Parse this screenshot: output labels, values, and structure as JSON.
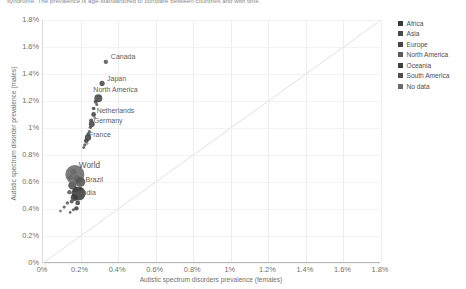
{
  "subtitle": "syndrome. The prevalence is age-standardized to compare between countries and with time.",
  "axes": {
    "x_title": "Autistic spectrum disorders prevalence (females)",
    "y_title": "Autistic spectrum disorder prevalence (males)",
    "x_ticks": [
      "0%",
      "0.2%",
      "0.4%",
      "0.6%",
      "0.8%",
      "1%",
      "1.2%",
      "1.4%",
      "1.6%",
      "1.8%"
    ],
    "y_ticks": [
      "0%",
      "0.2%",
      "0.4%",
      "0.6%",
      "0.8%",
      "1%",
      "1.2%",
      "1.4%",
      "1.6%",
      "1.8%"
    ]
  },
  "legend": {
    "items": [
      {
        "label": "Africa",
        "color": "#3a3a3a"
      },
      {
        "label": "Asia",
        "color": "#4a4a4a"
      },
      {
        "label": "Europe",
        "color": "#454545"
      },
      {
        "label": "North America",
        "color": "#5a5a5a"
      },
      {
        "label": "Oceania",
        "color": "#3f3f3f"
      },
      {
        "label": "South America",
        "color": "#4e4e4e"
      },
      {
        "label": "No data",
        "color": "#6a6a6a"
      }
    ]
  },
  "chart_data": {
    "type": "scatter",
    "title": "",
    "subtitle": "syndrome. The prevalence is age-standardized to compare between countries and with time.",
    "xlabel": "Autistic spectrum disorders prevalence (females)",
    "ylabel": "Autistic spectrum disorder prevalence (males)",
    "xlim": [
      0,
      1.8
    ],
    "ylim": [
      0,
      1.8
    ],
    "xunit": "%",
    "yunit": "%",
    "grid": true,
    "legend_position": "right",
    "reference_line": {
      "type": "y=x",
      "color": "#e2e2e2"
    },
    "labeled_points": [
      {
        "name": "Canada",
        "x": 0.34,
        "y": 1.49,
        "r": 2.2,
        "color": "#555555"
      },
      {
        "name": "Japan",
        "x": 0.32,
        "y": 1.33,
        "r": 2.6,
        "color": "#4c4c4c"
      },
      {
        "name": "North America",
        "x": 0.3,
        "y": 1.22,
        "r": 4.0,
        "color": "#4a4a4a"
      },
      {
        "name": "Netherlands",
        "x": 0.275,
        "y": 1.1,
        "r": 2.4,
        "color": "#444444"
      },
      {
        "name": "Germany",
        "x": 0.265,
        "y": 1.03,
        "r": 3.0,
        "color": "#474747"
      },
      {
        "name": "France",
        "x": 0.245,
        "y": 0.93,
        "r": 3.2,
        "color": "#434343"
      },
      {
        "name": "World",
        "x": 0.175,
        "y": 0.655,
        "r": 9.5,
        "color": "#6a6a6a"
      },
      {
        "name": "Brazil",
        "x": 0.205,
        "y": 0.6,
        "r": 4.8,
        "color": "#555555"
      },
      {
        "name": "India",
        "x": 0.195,
        "y": 0.515,
        "r": 7.0,
        "color": "#3c3c3c"
      }
    ],
    "other_points": [
      {
        "x": 0.305,
        "y": 1.235,
        "r": 1.4,
        "color": "#8f8f8f"
      },
      {
        "x": 0.286,
        "y": 1.195,
        "r": 2.0,
        "color": "#4f4f4f"
      },
      {
        "x": 0.292,
        "y": 1.175,
        "r": 1.5,
        "color": "#595959"
      },
      {
        "x": 0.275,
        "y": 1.145,
        "r": 1.8,
        "color": "#464646"
      },
      {
        "x": 0.281,
        "y": 1.075,
        "r": 1.4,
        "color": "#8a8a8a"
      },
      {
        "x": 0.262,
        "y": 1.055,
        "r": 2.1,
        "color": "#4b4b4b"
      },
      {
        "x": 0.258,
        "y": 1.005,
        "r": 1.7,
        "color": "#525252"
      },
      {
        "x": 0.252,
        "y": 0.975,
        "r": 1.5,
        "color": "#585858"
      },
      {
        "x": 0.246,
        "y": 0.955,
        "r": 1.8,
        "color": "#4a4a4a"
      },
      {
        "x": 0.236,
        "y": 0.905,
        "r": 2.4,
        "color": "#414141"
      },
      {
        "x": 0.228,
        "y": 0.875,
        "r": 1.6,
        "color": "#505050"
      },
      {
        "x": 0.241,
        "y": 0.885,
        "r": 1.2,
        "color": "#8d8d8d"
      },
      {
        "x": 0.222,
        "y": 0.855,
        "r": 1.4,
        "color": "#4d4d4d"
      },
      {
        "x": 0.168,
        "y": 0.675,
        "r": 3.0,
        "color": "#666666"
      },
      {
        "x": 0.152,
        "y": 0.635,
        "r": 2.6,
        "color": "#5e5e5e"
      },
      {
        "x": 0.186,
        "y": 0.625,
        "r": 3.4,
        "color": "#555555"
      },
      {
        "x": 0.162,
        "y": 0.575,
        "r": 4.2,
        "color": "#4f4f4f"
      },
      {
        "x": 0.178,
        "y": 0.545,
        "r": 2.8,
        "color": "#606060"
      },
      {
        "x": 0.146,
        "y": 0.525,
        "r": 2.2,
        "color": "#5a5a5a"
      },
      {
        "x": 0.205,
        "y": 0.545,
        "r": 2.0,
        "color": "#484848"
      },
      {
        "x": 0.172,
        "y": 0.485,
        "r": 3.6,
        "color": "#3f3f3f"
      },
      {
        "x": 0.158,
        "y": 0.455,
        "r": 2.0,
        "color": "#545454"
      },
      {
        "x": 0.19,
        "y": 0.445,
        "r": 2.4,
        "color": "#464646"
      },
      {
        "x": 0.135,
        "y": 0.445,
        "r": 1.8,
        "color": "#626262"
      },
      {
        "x": 0.118,
        "y": 0.415,
        "r": 1.6,
        "color": "#575757"
      },
      {
        "x": 0.183,
        "y": 0.405,
        "r": 2.2,
        "color": "#3d3d3d"
      },
      {
        "x": 0.167,
        "y": 0.395,
        "r": 1.5,
        "color": "#5b5b5b"
      },
      {
        "x": 0.098,
        "y": 0.385,
        "r": 1.4,
        "color": "#6b6b6b"
      },
      {
        "x": 0.15,
        "y": 0.375,
        "r": 1.3,
        "color": "#505050"
      }
    ]
  }
}
